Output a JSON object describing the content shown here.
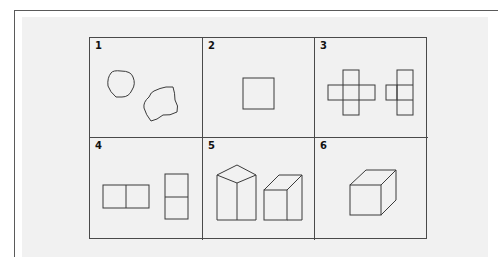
{
  "figure": {
    "title": "",
    "panels": [
      {
        "number": "1",
        "description": "two irregular blob shapes"
      },
      {
        "number": "2",
        "description": "square"
      },
      {
        "number": "3",
        "description": "cross-shaped cube net and column net"
      },
      {
        "number": "4",
        "description": "two-square rectangle horizontal and vertical"
      },
      {
        "number": "5",
        "description": "two prisms in perspective"
      },
      {
        "number": "6",
        "description": "cube in perspective"
      }
    ]
  },
  "colors": {
    "line": "#3a3a3a",
    "background": "#f1f1f1",
    "frame": "#5a5a5a"
  }
}
